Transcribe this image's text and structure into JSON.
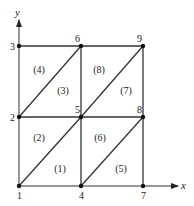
{
  "axes": {
    "x_label": "x",
    "y_label": "y"
  },
  "nodes": [
    {
      "id": "1",
      "x": 19,
      "y": 186
    },
    {
      "id": "2",
      "x": 19,
      "y": 117
    },
    {
      "id": "3",
      "x": 19,
      "y": 46
    },
    {
      "id": "4",
      "x": 81,
      "y": 186
    },
    {
      "id": "5",
      "x": 81,
      "y": 117
    },
    {
      "id": "6",
      "x": 81,
      "y": 46
    },
    {
      "id": "7",
      "x": 143,
      "y": 186
    },
    {
      "id": "8",
      "x": 143,
      "y": 117
    },
    {
      "id": "9",
      "x": 143,
      "y": 46
    }
  ],
  "elements": [
    {
      "label": "(1)",
      "x": 60,
      "y": 172
    },
    {
      "label": "(2)",
      "x": 39,
      "y": 141
    },
    {
      "label": "(3)",
      "x": 63,
      "y": 94
    },
    {
      "label": "(4)",
      "x": 39,
      "y": 73
    },
    {
      "label": "(5)",
      "x": 121,
      "y": 172
    },
    {
      "label": "(6)",
      "x": 100,
      "y": 141
    },
    {
      "label": "(7)",
      "x": 126,
      "y": 94
    },
    {
      "label": "(8)",
      "x": 99,
      "y": 73
    }
  ]
}
